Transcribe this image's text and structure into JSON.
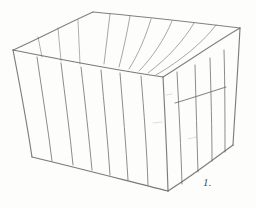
{
  "image": {
    "kind": "pencil-sketch",
    "subject": "open slatted wooden crate in three-quarter perspective view",
    "background_color": "#fdfdfc",
    "stroke_color": "#6b6b6b",
    "width": 256,
    "height": 208
  },
  "figure": {
    "label": "1.",
    "label_x": 203,
    "label_y": 176
  },
  "drawing": {
    "title": "",
    "rim": {
      "name": "box-rim-quadrilateral",
      "corners": {
        "left": [
          13,
          50
        ],
        "back": [
          93,
          12
        ],
        "right": [
          240,
          28
        ],
        "front": [
          163,
          77
        ]
      }
    },
    "base": {
      "name": "box-base-edges",
      "corners": {
        "left": [
          32,
          157
        ],
        "front": [
          168,
          191
        ],
        "right": [
          233,
          145
        ]
      }
    },
    "corner_posts": [
      {
        "name": "left-corner-post",
        "from": [
          13,
          50
        ],
        "to": [
          32,
          157
        ]
      },
      {
        "name": "front-corner-post",
        "from": [
          163,
          77
        ],
        "to": [
          168,
          191
        ]
      },
      {
        "name": "right-corner-post",
        "from": [
          240,
          28
        ],
        "to": [
          233,
          145
        ]
      }
    ],
    "front_panel_slats": {
      "name": "front-panel-slats",
      "count": 6,
      "top_x": [
        37,
        61,
        81,
        101,
        120,
        141
      ],
      "top_y": [
        57,
        63,
        67,
        70,
        73,
        76
      ],
      "bottom_x": [
        52,
        73,
        92,
        110,
        128,
        148
      ],
      "bottom_y": [
        161,
        165,
        170,
        175,
        180,
        185
      ]
    },
    "right_panel_slats": {
      "name": "right-panel-slats",
      "count": 4,
      "top_x": [
        177,
        195,
        210,
        224
      ],
      "top_y": [
        72,
        65,
        58,
        50
      ],
      "bottom_x": [
        182,
        198,
        212,
        225
      ],
      "bottom_y": [
        184,
        172,
        161,
        152
      ]
    },
    "right_panel_cross_brace": {
      "name": "right-panel-cross-brace",
      "from": [
        175,
        103
      ],
      "to": [
        226,
        87
      ]
    },
    "inner_back_wall_slats": {
      "name": "inner-back-wall-slats",
      "count": 6,
      "top_x": [
        110,
        130,
        151,
        172,
        194,
        216
      ],
      "top_y": [
        14,
        16,
        19,
        21,
        23,
        25
      ],
      "bottom_x": [
        104,
        119,
        129,
        139,
        148,
        156
      ],
      "bottom_y": [
        64,
        67,
        69,
        71,
        73,
        75
      ]
    },
    "inner_left_wall_slats": {
      "name": "inner-left-wall-slats",
      "count": 3,
      "top_x": [
        38,
        58,
        78
      ],
      "top_y": [
        37,
        28,
        20
      ],
      "bottom_x": [
        42,
        61,
        80
      ],
      "bottom_y": [
        57,
        61,
        64
      ]
    }
  }
}
